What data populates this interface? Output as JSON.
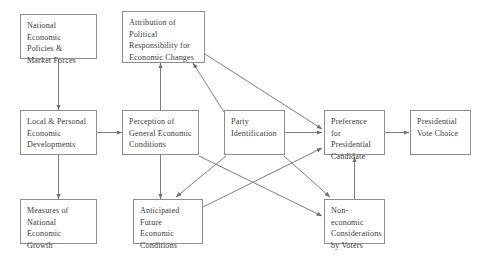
{
  "diagram": {
    "colors": {
      "box_border": "#8d8d8d",
      "edge": "#6e6e78",
      "text": "#3a3a3a",
      "background": "#ffffff"
    },
    "nodes": [
      {
        "id": "national-economic-policies",
        "label": "National Economic\nPolicies &\nMarket Forces",
        "x": 20,
        "y": 14,
        "w": 77,
        "h": 45
      },
      {
        "id": "attribution-of-political-responsibility",
        "label": "Attribution of\nPolitical\nResponsibility for\nEconomic Changes",
        "x": 122,
        "y": 11,
        "w": 83,
        "h": 52
      },
      {
        "id": "local-personal-economic-developments",
        "label": "Local & Personal\nEconomic\nDevelopments",
        "x": 20,
        "y": 110,
        "w": 77,
        "h": 45
      },
      {
        "id": "perception-of-general-economic-conditions",
        "label": "Perception of\nGeneral Economic\nConditions",
        "x": 122,
        "y": 110,
        "w": 77,
        "h": 45
      },
      {
        "id": "party-identification",
        "label": "Party\nIdentification",
        "x": 224,
        "y": 110,
        "w": 61,
        "h": 45
      },
      {
        "id": "preference-for-presidential-candidate",
        "label": "Preference for\nPresidential\nCandidate",
        "x": 324,
        "y": 110,
        "w": 61,
        "h": 45
      },
      {
        "id": "presidential-vote-choice",
        "label": "Presidential\nVote Choice",
        "x": 410,
        "y": 110,
        "w": 61,
        "h": 45
      },
      {
        "id": "measures-of-national-economic-growth",
        "label": "Measures of\nNational Economic\nGrowth",
        "x": 20,
        "y": 199,
        "w": 77,
        "h": 45
      },
      {
        "id": "anticipated-future-economic-conditions",
        "label": "Anticipated\nFuture Economic\nConditions",
        "x": 133,
        "y": 199,
        "w": 70,
        "h": 45
      },
      {
        "id": "non-economic-considerations-by-voters",
        "label": "Non-economic\nConsiderations\nby Voters",
        "x": 324,
        "y": 199,
        "w": 61,
        "h": 45
      }
    ],
    "edges": [
      {
        "id": "edge-national-policies-to-local-developments",
        "from": "national-economic-policies",
        "to": "local-personal-economic-developments",
        "points": "58.5,59 58.5,110",
        "arrow": true
      },
      {
        "id": "edge-local-developments-to-measures-of-growth",
        "from": "local-personal-economic-developments",
        "to": "measures-of-national-economic-growth",
        "points": "58.5,155 58.5,199",
        "arrow": true
      },
      {
        "id": "edge-local-developments-to-perception",
        "from": "local-personal-economic-developments",
        "to": "perception-of-general-economic-conditions",
        "points": "97,132.5 122,132.5",
        "arrow": true
      },
      {
        "id": "edge-perception-to-attribution",
        "from": "perception-of-general-economic-conditions",
        "to": "attribution-of-political-responsibility",
        "points": "160.5,110 160.5,63",
        "arrow": true
      },
      {
        "id": "edge-party-identification-to-attribution",
        "from": "party-identification",
        "to": "attribution-of-political-responsibility",
        "points": "224,112 193,63",
        "arrow": true
      },
      {
        "id": "edge-attribution-to-preference",
        "from": "attribution-of-political-responsibility",
        "to": "preference-for-presidential-candidate",
        "points": "205,54 322,129",
        "arrow": true
      },
      {
        "id": "edge-perception-to-anticipated",
        "from": "perception-of-general-economic-conditions",
        "to": "anticipated-future-economic-conditions",
        "points": "160.5,155 160.5,199",
        "arrow": true
      },
      {
        "id": "edge-party-identification-to-anticipated",
        "from": "party-identification",
        "to": "anticipated-future-economic-conditions",
        "points": "226,156 176,197",
        "arrow": true
      },
      {
        "id": "edge-perception-to-non-economic",
        "from": "perception-of-general-economic-conditions",
        "to": "non-economic-considerations-by-voters",
        "points": "199,156 322,216",
        "arrow": true
      },
      {
        "id": "edge-party-identification-to-non-economic",
        "from": "party-identification",
        "to": "non-economic-considerations-by-voters",
        "points": "284,156 330,197",
        "arrow": true
      },
      {
        "id": "edge-anticipated-to-preference",
        "from": "anticipated-future-economic-conditions",
        "to": "preference-for-presidential-candidate",
        "points": "203,207 322,148",
        "arrow": true
      },
      {
        "id": "edge-party-identification-to-preference",
        "from": "party-identification",
        "to": "preference-for-presidential-candidate",
        "points": "285,132.5 322,132.5",
        "arrow": true
      },
      {
        "id": "edge-non-economic-to-preference",
        "from": "non-economic-considerations-by-voters",
        "to": "preference-for-presidential-candidate",
        "points": "354.5,199 354.5,157",
        "arrow": true
      },
      {
        "id": "edge-preference-to-vote-choice",
        "from": "preference-for-presidential-candidate",
        "to": "presidential-vote-choice",
        "points": "385,132.5 409,132.5",
        "arrow": true
      }
    ]
  }
}
